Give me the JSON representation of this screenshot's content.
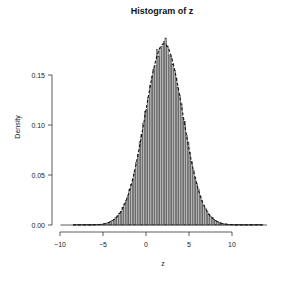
{
  "chart_data": {
    "type": "bar",
    "subtype": "histogram",
    "title": "Histogram of z",
    "xlabel": "z",
    "ylabel": "Density",
    "xlim": [
      -10,
      14
    ],
    "ylim": [
      0,
      0.19
    ],
    "x_ticks": [
      -10,
      -5,
      0,
      5,
      10
    ],
    "x_tick_labels": [
      "-10",
      "-5",
      "0",
      "5",
      "10"
    ],
    "y_ticks": [
      0.0,
      0.05,
      0.1,
      0.15
    ],
    "y_tick_labels": [
      "0.00",
      "0.05",
      "0.10",
      "0.15"
    ],
    "grid": false,
    "legend": null,
    "bin_width": 0.2,
    "overlay": {
      "type": "density-curve",
      "style": "dashed",
      "mean": 2.1,
      "sd": 2.2
    },
    "distribution_summary": {
      "approx_mean": 2.1,
      "approx_sd": 2.2,
      "peak_density": 0.187,
      "peak_x": 2.2,
      "min": -8.5,
      "max": 13.5
    },
    "bars_color": "#b8b8b8",
    "edge_color": "#333333"
  },
  "layout": {
    "plot_left_px": 60,
    "plot_right_px": 267,
    "x_zero_px": 146,
    "px_per_x_unit": 8.6,
    "y_zero_px": 225,
    "px_per_density": 1000
  }
}
